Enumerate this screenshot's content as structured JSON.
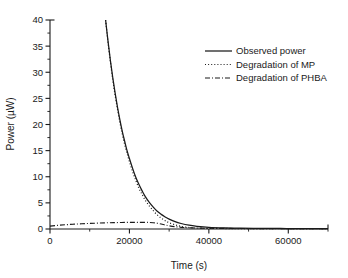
{
  "chart_data": {
    "type": "line",
    "title": "",
    "xlabel": "Time (s)",
    "ylabel": "Power (µW)",
    "xlim": [
      0,
      70000
    ],
    "ylim": [
      0,
      40
    ],
    "xticks": [
      0,
      20000,
      40000,
      60000
    ],
    "xtick_labels": [
      "0",
      "20000",
      "40000",
      "60000"
    ],
    "yticks": [
      0,
      5,
      10,
      15,
      20,
      25,
      30,
      35,
      40
    ],
    "ytick_labels": [
      "0",
      "5",
      "10",
      "15",
      "20",
      "25",
      "30",
      "35",
      "40"
    ],
    "x_minor_step": 10000,
    "y_minor_step": 2.5,
    "grid": false,
    "legend_position": "upper right",
    "series": [
      {
        "name": "Observed power",
        "style": "solid",
        "color": "#1a1a1a",
        "x": [
          14000,
          14600,
          15200,
          15800,
          16400,
          17000,
          17600,
          18200,
          18800,
          19400,
          20000,
          20800,
          21600,
          22400,
          23200,
          24000,
          25000,
          26000,
          27000,
          28000,
          29000,
          30000,
          31500,
          33000,
          35000,
          37000,
          40000,
          44000,
          48000,
          53000,
          58000,
          63000,
          70000
        ],
        "y": [
          40.0,
          36.0,
          32.3,
          29.0,
          26.0,
          23.3,
          20.9,
          18.7,
          16.8,
          15.0,
          13.5,
          11.6,
          9.9,
          8.5,
          7.3,
          6.2,
          5.1,
          4.2,
          3.4,
          2.8,
          2.3,
          1.9,
          1.4,
          1.05,
          0.72,
          0.52,
          0.33,
          0.22,
          0.17,
          0.13,
          0.1,
          0.08,
          0.05
        ]
      },
      {
        "name": "Degradation of MP",
        "style": "dotted",
        "color": "#1a1a1a",
        "x": [
          14000,
          14600,
          15200,
          15800,
          16400,
          17000,
          17600,
          18200,
          18800,
          19400,
          20000,
          20800,
          21600,
          22400,
          23200,
          24000,
          25000,
          26000,
          27000,
          28000,
          29000,
          30000,
          31500,
          33000,
          35000,
          37000,
          40000,
          44000,
          48000,
          53000,
          58000,
          63000,
          70000
        ],
        "y": [
          40.0,
          35.8,
          32.0,
          28.6,
          25.6,
          22.9,
          20.4,
          18.2,
          16.2,
          14.5,
          12.9,
          11.0,
          9.3,
          7.8,
          6.6,
          5.5,
          4.4,
          3.5,
          2.7,
          2.1,
          1.6,
          1.2,
          0.8,
          0.5,
          0.28,
          0.18,
          0.12,
          0.09,
          0.08,
          0.07,
          0.06,
          0.05,
          0.04
        ]
      },
      {
        "name": "Degradation of PHBA",
        "style": "dashdot",
        "color": "#1a1a1a",
        "x": [
          0,
          2000,
          4000,
          6000,
          8000,
          10000,
          12000,
          14000,
          16000,
          18000,
          20000,
          22000,
          24000,
          25000,
          26000,
          27000,
          28000,
          29000,
          30000,
          32000,
          34000,
          37000,
          40000,
          45000,
          50000,
          56000,
          62000,
          70000
        ],
        "y": [
          0.55,
          0.7,
          0.82,
          0.92,
          1.0,
          1.07,
          1.13,
          1.18,
          1.22,
          1.25,
          1.27,
          1.28,
          1.27,
          1.25,
          1.2,
          1.1,
          0.95,
          0.78,
          0.62,
          0.4,
          0.28,
          0.18,
          0.14,
          0.11,
          0.09,
          0.07,
          0.06,
          0.05
        ]
      }
    ]
  },
  "legend": {
    "entries": [
      {
        "label": "Observed power"
      },
      {
        "label": "Degradation of MP"
      },
      {
        "label": "Degradation of PHBA"
      }
    ]
  }
}
